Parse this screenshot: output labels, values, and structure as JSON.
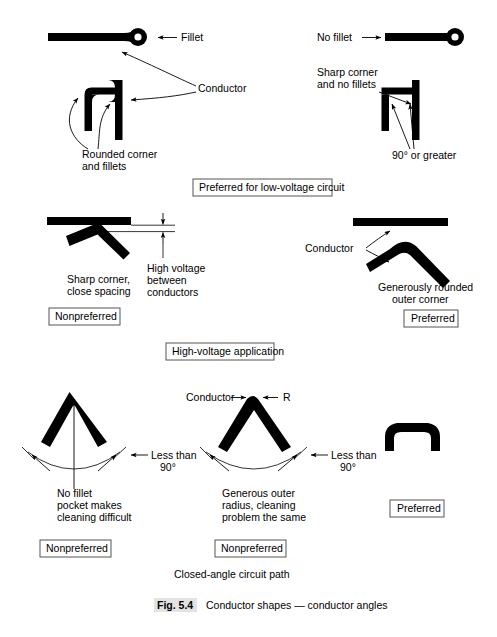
{
  "figure": {
    "number": "Fig. 5.4",
    "caption": "Conductor shapes — conductor angles"
  },
  "sections": {
    "top": {
      "title": "Preferred for low-voltage circuit",
      "left_labels": {
        "fillet": "Fillet",
        "conductor": "Conductor",
        "rounded_line1": "Rounded corner",
        "rounded_line2": "and fillets"
      },
      "right_labels": {
        "no_fillet": "No fillet",
        "sharp_line1": "Sharp corner",
        "sharp_line2": "and no fillets",
        "angle": "90° or greater"
      }
    },
    "middle": {
      "title": "High-voltage application",
      "left_labels": {
        "sharp_line1": "Sharp corner,",
        "sharp_line2": "close spacing",
        "badge": "Nonpreferred"
      },
      "dimension_labels": {
        "line1": "High voltage",
        "line2": "between",
        "line3": "conductors"
      },
      "right_labels": {
        "conductor": "Conductor",
        "rounded_line1": "Generously rounded",
        "rounded_line2": "outer corner",
        "badge": "Preferred"
      }
    },
    "bottom": {
      "title": "Closed-angle circuit path",
      "left": {
        "angle_line1": "Less than",
        "angle_line2": "90°",
        "note_line1": "No fillet",
        "note_line2": "pocket makes",
        "note_line3": "cleaning difficult",
        "badge": "Nonpreferred"
      },
      "middle": {
        "conductor": "Conductor",
        "radius": "R",
        "angle_line1": "Less than",
        "angle_line2": "90°",
        "note_line1": "Generous outer",
        "note_line2": "radius, cleaning",
        "note_line3": "problem the same",
        "badge": "Nonpreferred"
      },
      "right": {
        "badge": "Preferred"
      }
    }
  },
  "colors": {
    "conductor": "#000000",
    "leader": "#000000",
    "box_border": "#555555",
    "caption_highlight": "#e3e3e3",
    "background": "#ffffff"
  }
}
